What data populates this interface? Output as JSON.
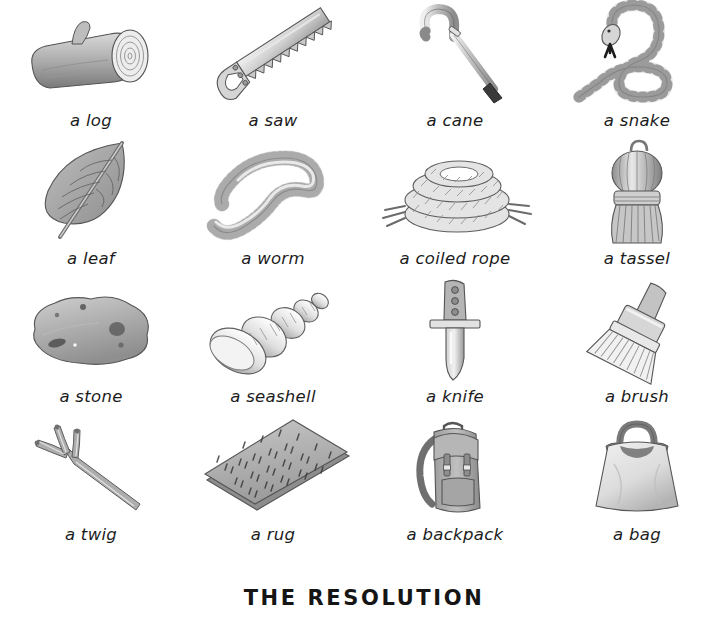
{
  "page": {
    "title": "THE RESOLUTION",
    "background_color": "#ffffff",
    "text_color": "#1c1c1c",
    "style": "grayscale watercolor illustrations with handwritten labels",
    "grid": {
      "columns": 4,
      "rows": 4
    }
  },
  "items": [
    {
      "label": "a log",
      "icon": "log-illustration"
    },
    {
      "label": "a saw",
      "icon": "saw-illustration"
    },
    {
      "label": "a cane",
      "icon": "cane-illustration"
    },
    {
      "label": "a snake",
      "icon": "snake-illustration"
    },
    {
      "label": "a leaf",
      "icon": "leaf-illustration"
    },
    {
      "label": "a worm",
      "icon": "worm-illustration"
    },
    {
      "label": "a coiled rope",
      "icon": "coiled-rope-illustration"
    },
    {
      "label": "a tassel",
      "icon": "tassel-illustration"
    },
    {
      "label": "a stone",
      "icon": "stone-illustration"
    },
    {
      "label": "a seashell",
      "icon": "seashell-illustration"
    },
    {
      "label": "a knife",
      "icon": "knife-illustration"
    },
    {
      "label": "a brush",
      "icon": "brush-illustration"
    },
    {
      "label": "a twig",
      "icon": "twig-illustration"
    },
    {
      "label": "a rug",
      "icon": "rug-illustration"
    },
    {
      "label": "a backpack",
      "icon": "backpack-illustration"
    },
    {
      "label": "a bag",
      "icon": "bag-illustration"
    }
  ],
  "palette": {
    "ink": "#3b3b3b",
    "light_gray": "#e6e6e6",
    "mid_gray": "#b8b8b8",
    "dark_gray": "#8a8a8a",
    "deep_gray": "#5a5a5a"
  }
}
